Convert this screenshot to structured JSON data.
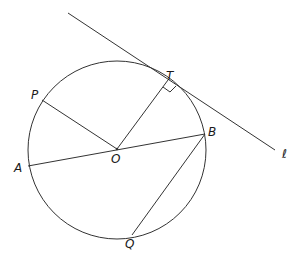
{
  "diagram": {
    "type": "geometry-circle-tangent",
    "circle": {
      "center": "O",
      "cx": 117,
      "cy": 150,
      "r": 89
    },
    "points": {
      "O": {
        "label": "O",
        "x": 117,
        "y": 149,
        "lx": 111,
        "ly": 163
      },
      "T": {
        "label": "T",
        "x": 168,
        "y": 80,
        "lx": 166,
        "ly": 80
      },
      "P": {
        "label": "P",
        "x": 42,
        "y": 100,
        "lx": 31,
        "ly": 99
      },
      "A": {
        "label": "A",
        "x": 28,
        "y": 166,
        "lx": 14,
        "ly": 172
      },
      "B": {
        "label": "B",
        "x": 205,
        "y": 134,
        "lx": 208,
        "ly": 136
      },
      "Q": {
        "label": "Q",
        "x": 132,
        "y": 235,
        "lx": 125,
        "ly": 248
      }
    },
    "tangent_line": {
      "label": "ℓ",
      "x1": 68,
      "y1": 13,
      "x2": 275,
      "y2": 150,
      "lx": 282,
      "ly": 158
    },
    "segments": [
      "OP",
      "OT",
      "AB",
      "BQ"
    ],
    "right_angle_at": "T"
  }
}
